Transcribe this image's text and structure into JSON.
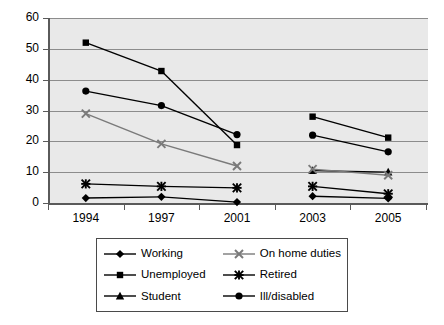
{
  "chart_data": {
    "type": "line",
    "title": "",
    "xlabel": "",
    "ylabel": "",
    "categories": [
      "1994",
      "1997",
      "2001",
      "2003",
      "2005"
    ],
    "ylim": [
      0,
      60
    ],
    "ytick_labels": [
      "0",
      "10",
      "20",
      "30",
      "40",
      "50",
      "60"
    ],
    "ytick_values": [
      0,
      10,
      20,
      30,
      40,
      50,
      60
    ],
    "grid": true,
    "legend_position": "bottom",
    "series": [
      {
        "name": "Working",
        "marker": "diamond",
        "color": "#000000",
        "values": [
          1.6,
          2.0,
          0.3,
          2.2,
          1.5
        ]
      },
      {
        "name": "Unemployed",
        "marker": "square",
        "color": "#000000",
        "values": [
          52.0,
          42.8,
          18.8,
          28.0,
          21.2
        ]
      },
      {
        "name": "Student",
        "marker": "triangle",
        "color": "#000000",
        "values": [
          null,
          null,
          null,
          10.5,
          10.0
        ]
      },
      {
        "name": "On home duties",
        "marker": "cross",
        "color": "#7a7a7a",
        "values": [
          29.0,
          19.2,
          12.0,
          11.0,
          9.0
        ]
      },
      {
        "name": "Retired",
        "marker": "star",
        "color": "#000000",
        "values": [
          6.2,
          5.4,
          4.9,
          5.4,
          3.0
        ]
      },
      {
        "name": "Ill/disabled",
        "marker": "circle",
        "color": "#000000",
        "values": [
          36.3,
          31.6,
          22.2,
          22.0,
          16.6
        ]
      }
    ],
    "series_breaks": [
      [
        2,
        3
      ]
    ],
    "plot_background": "#e9e9e9",
    "gridline_color": "#8c8c8c",
    "axis_color": "#5a5a5a"
  }
}
